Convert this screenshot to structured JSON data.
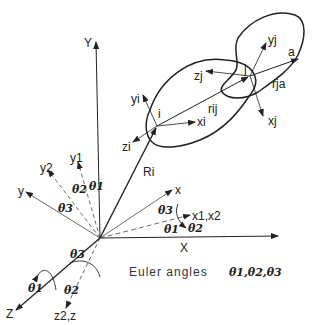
{
  "diagram": {
    "title": "Euler angles",
    "caption": {
      "text": "Euler angles",
      "angles": "θ1,θ2,θ3"
    },
    "global_axes": {
      "X": "X",
      "Y": "Y",
      "Z": "Z"
    },
    "body_axes": {
      "x": "x",
      "y": "y",
      "z2z": "z2,z"
    },
    "intermediate_axes": {
      "y1": "y1",
      "y2": "y2",
      "x1x2": "x1,x2"
    },
    "angles": {
      "t1": "θ1",
      "t2": "θ2",
      "t3": "θ3"
    },
    "site_i": {
      "label": "i",
      "xi": "xi",
      "yi": "yi",
      "zi": "zi"
    },
    "site_j": {
      "label": "j",
      "xj": "xj",
      "yj": "yj",
      "zj": "zj"
    },
    "vectors": {
      "Ri": "Ri",
      "rij": "rij",
      "rja": "rja",
      "a": "a"
    }
  }
}
